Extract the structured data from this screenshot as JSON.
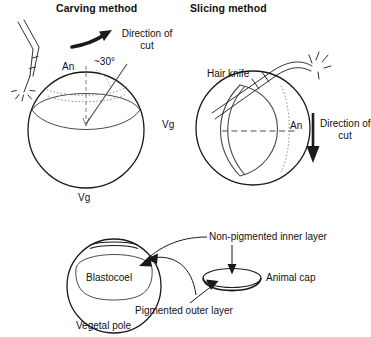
{
  "figure": {
    "background_color": "#ffffff",
    "stroke_color": "#1a1a1a",
    "panels": [
      {
        "id": "carving",
        "title": "Carving method"
      },
      {
        "id": "slicing",
        "title": "Slicing method"
      },
      {
        "id": "result",
        "title": ""
      }
    ]
  },
  "carving": {
    "title": "Carving method",
    "direction_label_line1": "Direction of",
    "direction_label_line2": "cut",
    "animal_pole_label": "An",
    "angle_label": "~30°",
    "vegetal_pole_label": "Vg",
    "tool_name": "hair-knife-needle"
  },
  "slicing": {
    "title": "Slicing method",
    "tool_label": "Hair knife",
    "vegetal_pole_label": "Vg",
    "animal_pole_label": "An",
    "direction_label_line1": "Direction of",
    "direction_label_line2": "cut"
  },
  "result": {
    "blastocoel_label": "Blastocoel",
    "vegetal_pole_label": "Vegetal pole",
    "non_pigmented_label": "Non-pigmented inner layer",
    "pigmented_label": "Pigmented outer layer",
    "animal_cap_label": "Animal cap"
  }
}
